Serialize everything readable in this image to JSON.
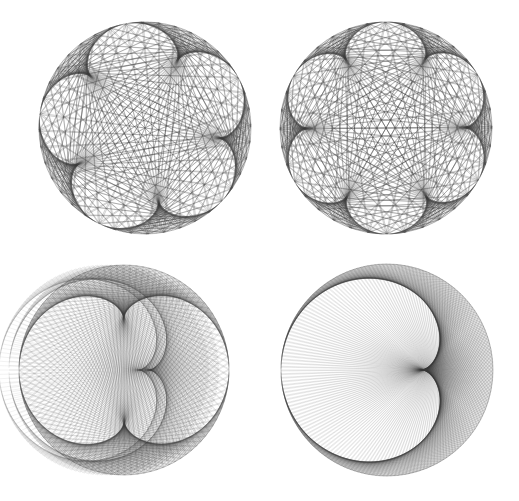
{
  "background": "#ffffff",
  "stroke_color": "#3a3a3a",
  "figures": [
    {
      "id": "top-left",
      "x": 0,
      "y": 0,
      "w": 260,
      "h": 250,
      "cx": 145,
      "cy": 128,
      "r": 106,
      "points": 240,
      "multiplier": 6,
      "rotation_deg": 100,
      "opacity": 0.55,
      "stroke_width": 0.45,
      "cusps": 5
    },
    {
      "id": "top-right",
      "x": 260,
      "y": 0,
      "w": 259,
      "h": 250,
      "cx": 126,
      "cy": 128,
      "r": 106,
      "points": 252,
      "multiplier": 7,
      "rotation_deg": 90,
      "opacity": 0.55,
      "stroke_width": 0.45,
      "cusps": 6
    },
    {
      "id": "bottom-left",
      "x": 0,
      "y": 250,
      "w": 260,
      "h": 251,
      "cx": 124,
      "cy": 120,
      "r": 105,
      "points": 300,
      "multiplier": 3,
      "rotation_deg": 0,
      "opacity": 0.35,
      "stroke_width": 0.35,
      "cusps": 2,
      "extra_rings": [
        {
          "dx": -10,
          "r": 105,
          "mult": 2,
          "opacity": 0.25
        },
        {
          "dx": -20,
          "r": 105,
          "mult": 2,
          "opacity": 0.2
        }
      ]
    },
    {
      "id": "bottom-right",
      "x": 260,
      "y": 250,
      "w": 259,
      "h": 251,
      "cx": 127,
      "cy": 120,
      "r": 106,
      "points": 360,
      "multiplier": 2,
      "rotation_deg": 180,
      "opacity": 0.32,
      "stroke_width": 0.35,
      "cusps": 1
    }
  ]
}
